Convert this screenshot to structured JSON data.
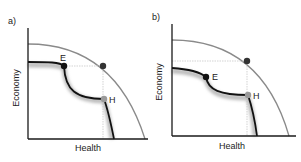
{
  "panels": [
    {
      "id": "a",
      "label": "a)",
      "xlabel": "Health",
      "ylabel": "Economy",
      "points": {
        "E": "E",
        "H": "H"
      }
    },
    {
      "id": "b",
      "label": "b)",
      "xlabel": "Health",
      "ylabel": "Economy",
      "points": {
        "E": "E",
        "H": "H"
      }
    }
  ],
  "colors": {
    "axis": "#1a1a1a",
    "frontier": "#8a8a8a",
    "curve": "#111111",
    "point_E": "#111111",
    "point_H": "#9a9a9a",
    "point_target": "#333333",
    "guide": "#c8c8c8",
    "shadow": "#bdbdbd"
  }
}
